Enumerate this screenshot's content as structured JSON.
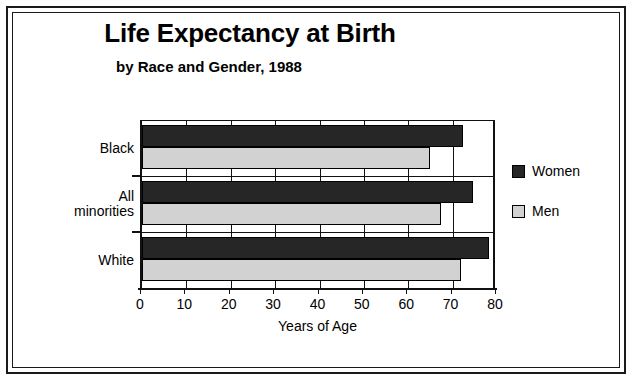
{
  "chart_data": {
    "type": "bar",
    "orientation": "horizontal",
    "title": "Life Expectancy at Birth",
    "subtitle": "by Race and Gender, 1988",
    "xlabel": "Years of Age",
    "ylabel": "",
    "xlim": [
      0,
      80
    ],
    "xticks": [
      0,
      10,
      20,
      30,
      40,
      50,
      60,
      70,
      80
    ],
    "xtick_labels": [
      "0",
      "10",
      "20",
      "30",
      "40",
      "50",
      "60",
      "70",
      "80"
    ],
    "grid": "vertical",
    "legend_position": "right",
    "categories": [
      "Black",
      "All minorities",
      "White"
    ],
    "series": [
      {
        "name": "Women",
        "color": "#262626",
        "values": [
          72.3,
          74.5,
          78.2
        ]
      },
      {
        "name": "Men",
        "color": "#d2d2d2",
        "values": [
          65.0,
          67.3,
          71.8
        ]
      }
    ]
  },
  "legend": {
    "items": [
      {
        "label": "Women",
        "color": "#262626"
      },
      {
        "label": "Men",
        "color": "#d2d2d2"
      }
    ]
  },
  "colors": {
    "women": "#262626",
    "men": "#d2d2d2",
    "ink": "#111111",
    "background": "#ffffff"
  }
}
